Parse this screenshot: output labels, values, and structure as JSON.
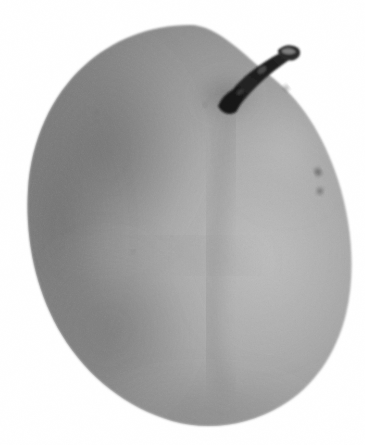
{
  "image": {
    "kind": "photograph",
    "subject": "pear",
    "subject_label": "Asian pear fruit",
    "description": "Black and white photograph of a single pear-shaped fruit with a short woody stem, isolated on a plain white background",
    "color_mode": "grayscale",
    "width": 365,
    "height": 445,
    "background_color": "#ffffff",
    "caption": "",
    "alt_text": "Grayscale photograph of a pear with a dark broken stem on a white background"
  },
  "palette": {
    "background": "#ffffff",
    "body_midtone": "#9b9b9b",
    "body_highlight": "#b6b6b6",
    "body_shadow": "#787878",
    "body_rim_shadow": "#6b6b6b",
    "body_deep_shadow": "#5f5f5f",
    "stem_dark": "#1b1b1b",
    "stem_mid": "#3a3a3a",
    "stem_highlight": "#8e8e8e",
    "blemish": "#4a4a4a"
  },
  "subject": {
    "body": {
      "name": "fruit body",
      "center_x": 188,
      "center_y": 232,
      "bounds": {
        "left": 28,
        "top": 25,
        "right": 351,
        "bottom": 426
      },
      "shape": "ovoid",
      "lobes": 2
    },
    "stem": {
      "name": "stem",
      "base_x": 232,
      "base_y": 102,
      "tip_x": 292,
      "tip_y": 52,
      "condition": "broken tip",
      "color": "#1b1b1b"
    },
    "notch": {
      "name": "stem cavity notch",
      "x": 205,
      "y": 48
    },
    "blemishes": [
      {
        "name": "speckle-right-upper",
        "x": 318,
        "y": 172,
        "rx": 2.6,
        "ry": 3.6,
        "rotate": -25
      },
      {
        "name": "speckle-right-lower",
        "x": 320,
        "y": 191,
        "rx": 2.4,
        "ry": 2.8,
        "rotate": 10
      },
      {
        "name": "speckle-shoulder",
        "x": 286,
        "y": 88,
        "rx": 2.2,
        "ry": 2.6,
        "rotate": -40
      },
      {
        "name": "speckle-upper-left",
        "x": 97,
        "y": 112,
        "rx": 1.5,
        "ry": 1.8,
        "rotate": 0
      },
      {
        "name": "speckle-mid-left",
        "x": 133,
        "y": 252,
        "rx": 1.4,
        "ry": 1.6,
        "rotate": 0
      },
      {
        "name": "speckle-center",
        "x": 205,
        "y": 105,
        "rx": 1.5,
        "ry": 1.7,
        "rotate": 0
      }
    ],
    "highlight": {
      "name": "specular highlight",
      "x": 268,
      "y": 258,
      "rx": 74,
      "ry": 96
    },
    "crease": {
      "name": "lobe crease",
      "from_x": 228,
      "from_y": 110,
      "to_x": 210,
      "to_y": 330
    }
  },
  "texture": {
    "grain": "fine film grain",
    "grain_opacity": 0.22,
    "stipple_opacity": 0.15
  }
}
